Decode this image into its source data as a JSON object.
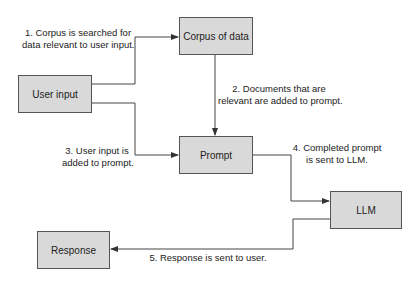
{
  "nodes": {
    "user_input": "User input",
    "corpus": "Corpus of data",
    "prompt": "Prompt",
    "llm": "LLM",
    "response": "Response"
  },
  "steps": {
    "s1_line1": "1. Corpus is searched for",
    "s1_line2": "data relevant to user input.",
    "s2_line1": "2. Documents that are",
    "s2_line2": "relevant are added to prompt.",
    "s3_line1": "3. User input is",
    "s3_line2": "added to prompt.",
    "s4_line1": "4. Completed prompt",
    "s4_line2": "is sent to LLM.",
    "s5": "5. Response is sent to user."
  },
  "colors": {
    "box_fill": "#d9d9d9",
    "line": "#444444"
  }
}
